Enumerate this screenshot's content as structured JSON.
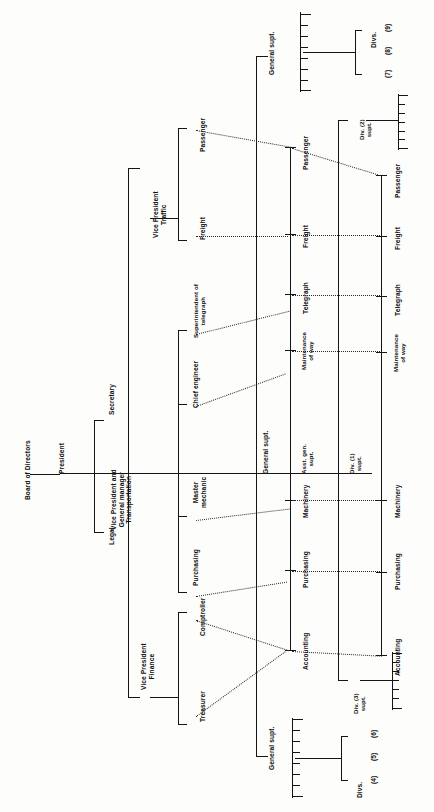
{
  "document": {
    "title": "Board of Directors",
    "orientation": "rotated-90-ccw",
    "ink_color": "#151515",
    "paper_color": "#fdfdfc"
  },
  "nodes": {
    "board": "Board of Directors",
    "president": "President",
    "legal": "Legal",
    "secretary": "Secretary",
    "vp_transportation": "Vice President and\nGeneral manager\nTransportation",
    "vp_finance": "Vice President\nFinance",
    "vp_traffic": "Vice President\nTraffic",
    "treasurer": "Treasurer",
    "comptroller": "Comptroller",
    "purchasing_staff": "Purchasing",
    "master_mechanic": "Master\nmechanic",
    "chief_engineer": "Chief engineer",
    "supt_telegraph": "Superintendent of\ntelegraph",
    "traffic_freight": "Freight",
    "traffic_passenger": "Passenger",
    "general_supt_mid": "General supt.",
    "general_supt_top": "General supt.",
    "general_supt_bottom": "General supt.",
    "asst_gen_supt": "Asst. gen.\nsupt.",
    "div1_supt": "Div. (1)\nsupt.",
    "div2_supt": "Div. (2)\nsupt.",
    "div3_supt": "Div. (3)\nsupt.",
    "divs_456": "Divs.",
    "divs_789": "Divs."
  },
  "functional_columns": {
    "asst_gen_supt_line": [
      "Accounting",
      "Purchasing",
      "Machinery",
      "Maintenance\nof way",
      "Telegraph",
      "Freight",
      "Passenger"
    ],
    "div1_supt_line": [
      "Accounting",
      "Purchasing",
      "Machinery",
      "Maintenance\nof way",
      "Telegraph",
      "Freight",
      "Passenger"
    ]
  },
  "division_numbers": {
    "group_456": [
      "(4)",
      "(5)",
      "(6)"
    ],
    "group_789": [
      "(7)",
      "(8)",
      "(9)"
    ]
  }
}
